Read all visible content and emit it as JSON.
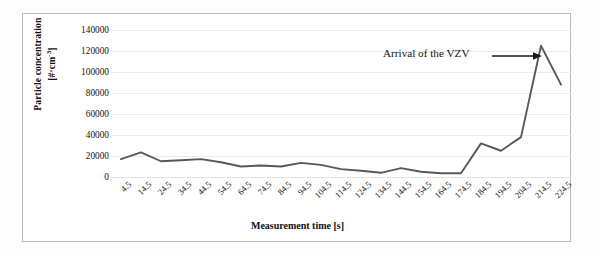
{
  "figure": {
    "background_color": "#ffffff",
    "frame_color": "#b9b9b9",
    "series_color": "#595959",
    "gridline_color": "#ededed"
  },
  "axes": {
    "y_title_main": "Particle concentration",
    "y_title_unit_prefix": "[#·cm",
    "y_title_unit_exp": "-3",
    "y_title_unit_suffix": "]",
    "x_title": "Measurement time [s]",
    "y_ticks": [
      "140000",
      "120000",
      "100000",
      "80000",
      "60000",
      "40000",
      "20000",
      "0"
    ],
    "x_ticks": [
      "4.5",
      "14.5",
      "24.5",
      "34.5",
      "44.5",
      "54.5",
      "64.5",
      "74.5",
      "84.5",
      "94.5",
      "104.5",
      "114.5",
      "124.5",
      "134.5",
      "144.5",
      "154.5",
      "164.5",
      "174.5",
      "184.5",
      "194.5",
      "204.5",
      "214.5",
      "224.5"
    ]
  },
  "annotation": {
    "label": "Arrival of the VZV",
    "arrow_icon": "right-arrow-icon"
  },
  "chart_data": {
    "type": "line",
    "title": "",
    "xlabel": "Measurement time [s]",
    "ylabel": "Particle concentration [#·cm-3]",
    "categories": [
      "4.5",
      "14.5",
      "24.5",
      "34.5",
      "44.5",
      "54.5",
      "64.5",
      "74.5",
      "84.5",
      "94.5",
      "104.5",
      "114.5",
      "124.5",
      "134.5",
      "144.5",
      "154.5",
      "164.5",
      "174.5",
      "184.5",
      "194.5",
      "204.5",
      "214.5",
      "224.5"
    ],
    "values": [
      17000,
      23500,
      15000,
      16000,
      17000,
      14000,
      10000,
      11000,
      10000,
      13500,
      11500,
      7500,
      6000,
      4000,
      8500,
      5000,
      3500,
      3500,
      32000,
      25000,
      38000,
      125000,
      88000
    ],
    "ylim": [
      0,
      140000
    ],
    "ytick_step": 20000,
    "grid": true,
    "legend": "none",
    "annotations": [
      {
        "text": "Arrival of the VZV",
        "points_to_category": "214.5",
        "points_to_value": 125000
      }
    ]
  }
}
